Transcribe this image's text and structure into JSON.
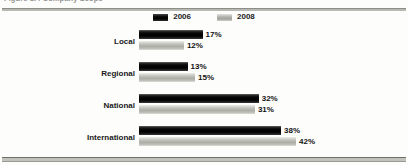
{
  "figure": {
    "caption": "Figure 1.4 Company Scope",
    "caption_clipped": true
  },
  "legend": {
    "position": "top-center",
    "entries": [
      {
        "label": "2006",
        "swatch": "swatch-2006",
        "color": "#000000"
      },
      {
        "label": "2008",
        "swatch": "swatch-2008",
        "color": "#b4b4af"
      }
    ]
  },
  "chart_data": {
    "type": "bar",
    "orientation": "horizontal",
    "title": "Figure 1.4 Company Scope",
    "xlabel": "",
    "ylabel": "",
    "grid": false,
    "legend_position": "top-center",
    "xlim": [
      0,
      45
    ],
    "categories": [
      "Local",
      "Regional",
      "National",
      "International"
    ],
    "series": [
      {
        "name": "2006",
        "color": "#000000",
        "values": [
          17,
          13,
          32,
          38
        ]
      },
      {
        "name": "2008",
        "color": "#b4b4af",
        "values": [
          12,
          15,
          31,
          42
        ]
      }
    ],
    "value_labels": [
      {
        "category": "Local",
        "series": "2006",
        "text": "17%"
      },
      {
        "category": "Local",
        "series": "2008",
        "text": "12%"
      },
      {
        "category": "Regional",
        "series": "2006",
        "text": "13%"
      },
      {
        "category": "Regional",
        "series": "2008",
        "text": "15%"
      },
      {
        "category": "National",
        "series": "2006",
        "text": "32%"
      },
      {
        "category": "National",
        "series": "2008",
        "text": "31%"
      },
      {
        "category": "International",
        "series": "2006",
        "text": "38%"
      },
      {
        "category": "International",
        "series": "2008",
        "text": "42%"
      }
    ]
  },
  "scale": {
    "bar_origin_x": 139,
    "px_per_percent": 3.74
  }
}
